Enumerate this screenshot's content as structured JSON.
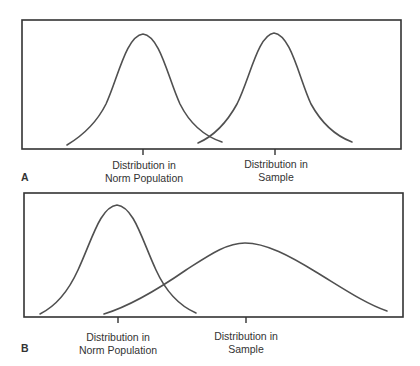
{
  "figure": {
    "colors": {
      "frame": "#333333",
      "curve": "#505050",
      "text": "#333333"
    },
    "panels": [
      {
        "letter": "A",
        "description": "Two normal distributions with equal spread, sample distribution shifted to the right of norm population",
        "curves": [
          {
            "name": "Distribution in Norm Population",
            "center_x": 143,
            "peak_y": 34,
            "start": [
              67,
              145
            ],
            "end": [
              222,
              142
            ],
            "spread": "narrow"
          },
          {
            "name": "Distribution in Sample",
            "center_x": 274,
            "peak_y": 33,
            "start": [
              198,
              143
            ],
            "end": [
              352,
              142
            ],
            "spread": "narrow"
          }
        ],
        "labels": [
          {
            "line1": "Distribution in",
            "line2": "Norm Population"
          },
          {
            "line1": "Distribution in",
            "line2": "Sample"
          }
        ]
      },
      {
        "letter": "B",
        "description": "Norm population distribution narrow and tall; sample distribution wider and flatter, centered to the right",
        "curves": [
          {
            "name": "Distribution in Norm Population",
            "center_x": 117,
            "peak_y": 205,
            "start": [
              40,
              314
            ],
            "end": [
              196,
              313
            ],
            "spread": "narrow"
          },
          {
            "name": "Distribution in Sample",
            "center_x": 245,
            "peak_y": 243,
            "start": [
              104,
              314
            ],
            "end": [
              387,
              311
            ],
            "spread": "wide"
          }
        ],
        "labels": [
          {
            "line1": "Distribution in",
            "line2": "Norm Population"
          },
          {
            "line1": "Distribution in",
            "line2": "Sample"
          }
        ]
      }
    ]
  }
}
